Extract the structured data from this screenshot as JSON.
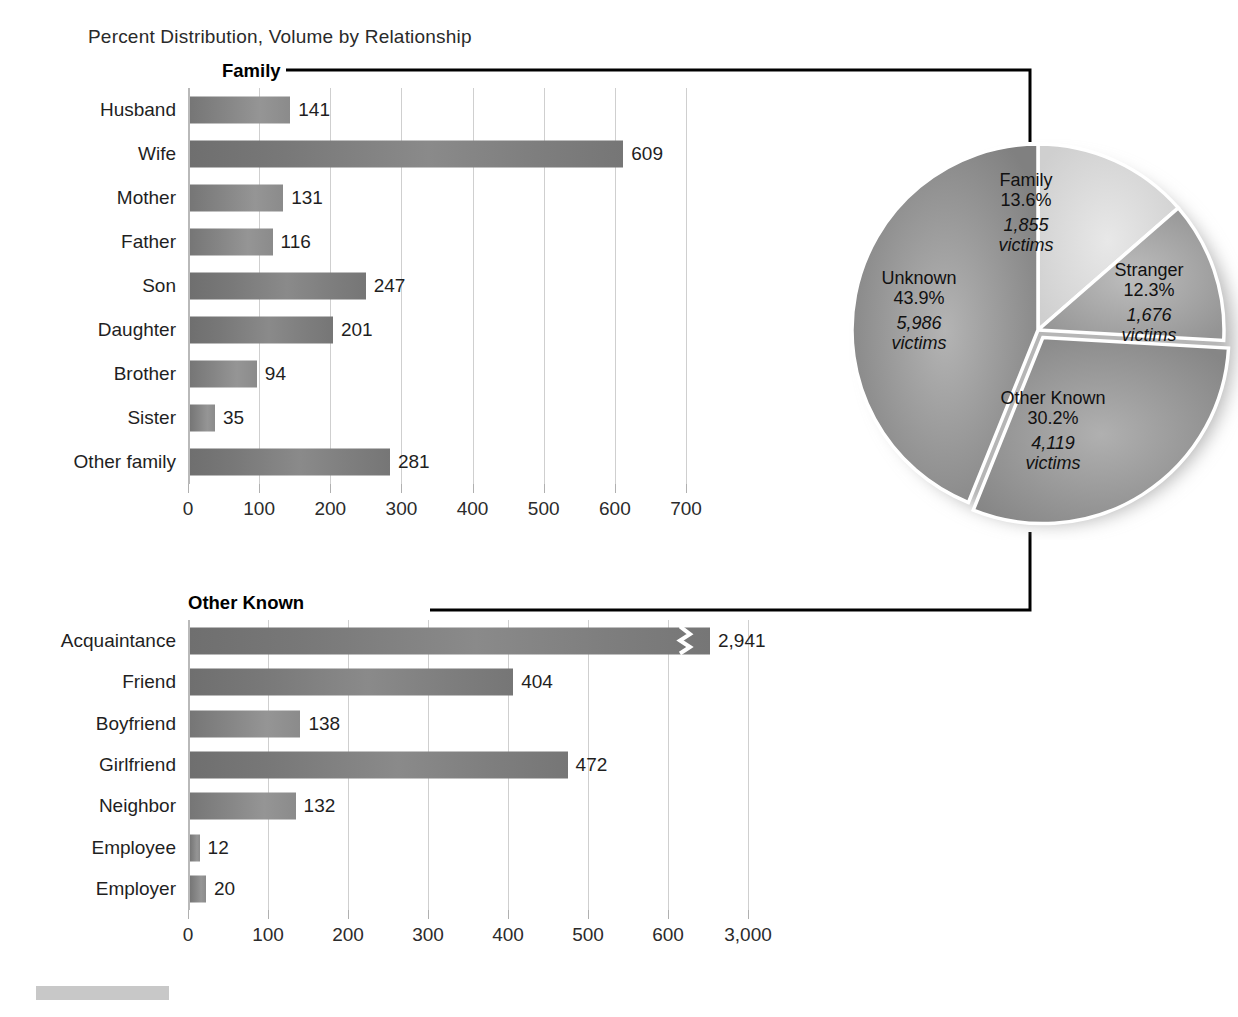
{
  "suptitle": "Percent Distribution, Volume by Relationship",
  "panels": {
    "family": {
      "title": "Family"
    },
    "other_known": {
      "title": "Other Known"
    }
  },
  "colors": {
    "bar_dark": "#6f6f6f",
    "bar_mid": "#8a8a8a",
    "pie_family": "#d6d6d6",
    "pie_stranger": "#9e9e9e",
    "pie_other_known": "#8d8d8d",
    "pie_unknown": "#8a8a8a",
    "gridline": "#cfcfcf",
    "connector": "#000000",
    "footer_swatch": "#c8c8c8"
  },
  "chart_data": [
    {
      "type": "bar",
      "orientation": "horizontal",
      "name": "family-bar-chart",
      "title": "Family",
      "categories": [
        "Husband",
        "Wife",
        "Mother",
        "Father",
        "Son",
        "Daughter",
        "Brother",
        "Sister",
        "Other family"
      ],
      "values": [
        141,
        609,
        131,
        116,
        247,
        201,
        94,
        35,
        281
      ],
      "value_labels": [
        "141",
        "609",
        "131",
        "116",
        "247",
        "201",
        "94",
        "35",
        "281"
      ],
      "xlabel": "",
      "ylabel": "",
      "xlim": [
        0,
        700
      ],
      "xticks": [
        0,
        100,
        200,
        300,
        400,
        500,
        600,
        700
      ],
      "xticklabels": [
        "0",
        "100",
        "200",
        "300",
        "400",
        "500",
        "600",
        "700"
      ],
      "grid": true,
      "legend": "none"
    },
    {
      "type": "bar",
      "orientation": "horizontal",
      "name": "other-known-bar-chart",
      "title": "Other Known",
      "categories": [
        "Acquaintance",
        "Friend",
        "Boyfriend",
        "Girlfriend",
        "Neighbor",
        "Employee",
        "Employer"
      ],
      "values": [
        2941,
        404,
        138,
        472,
        132,
        12,
        20
      ],
      "value_labels": [
        "2,941",
        "404",
        "138",
        "472",
        "132",
        "12",
        "20"
      ],
      "broken_axis": true,
      "broken_axis_note": "Acquaintance bar drawn with a zigzag break; last tick jumps from 600 to 3,000",
      "xlabel": "",
      "ylabel": "",
      "xlim": [
        0,
        600
      ],
      "xticks": [
        0,
        100,
        200,
        300,
        400,
        500,
        600,
        3000
      ],
      "xticklabels": [
        "0",
        "100",
        "200",
        "300",
        "400",
        "500",
        "600",
        "3,000"
      ],
      "grid": true,
      "legend": "none"
    },
    {
      "type": "pie",
      "name": "relationship-pie-chart",
      "title": "",
      "categories": [
        "Family",
        "Stranger",
        "Other Known",
        "Unknown"
      ],
      "values": [
        13.6,
        12.3,
        30.2,
        43.9
      ],
      "counts": [
        1855,
        1676,
        4119,
        5986
      ],
      "slices": [
        {
          "label": "Family",
          "pct": "13.6%",
          "victims": "1,855",
          "victims_word": "victims"
        },
        {
          "label": "Stranger",
          "pct": "12.3%",
          "victims": "1,676",
          "victims_word": "victims"
        },
        {
          "label": "Other Known",
          "pct": "30.2%",
          "victims": "4,119",
          "victims_word": "victims"
        },
        {
          "label": "Unknown",
          "pct": "43.9%",
          "victims": "5,986",
          "victims_word": "victims"
        }
      ],
      "legend": "none",
      "units": "percent of victims"
    }
  ]
}
